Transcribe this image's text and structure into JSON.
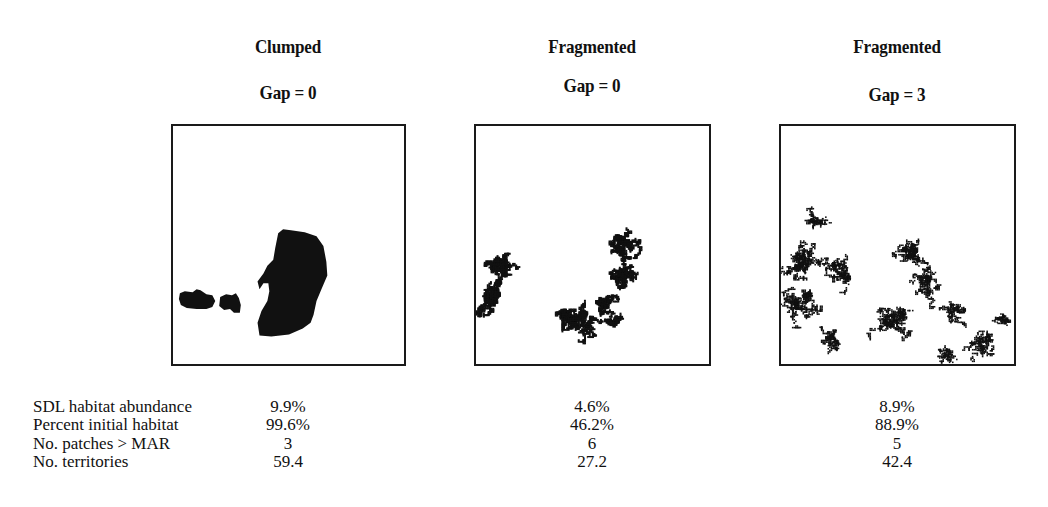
{
  "figure": {
    "panels": [
      {
        "title": "Clumped",
        "subtitle": "Gap = 0",
        "pattern": "clumped",
        "box": {
          "x": 171,
          "y": 124,
          "w": 235,
          "h": 242
        },
        "title_y": 36,
        "subtitle_y": 82,
        "blobs": [
          {
            "type": "path",
            "d": "M107 109 L112 105 L120 106 L134 108 L146 112 L153 122 L156 138 L157 152 L151 166 L146 178 L143 192 L140 200 L132 206 L118 212 L100 214 L88 213 L86 200 L90 188 L96 178 L98 168 L97 160 L92 160 L88 166 L86 158 L92 150 L96 142 L102 136 L104 124 Z"
          },
          {
            "type": "path",
            "d": "M7 170 L12 168 L20 169 L24 166 L28 167 L34 171 L40 172 L43 178 L40 184 L34 186 L24 186 L14 185 L8 182 L6 176 Z"
          },
          {
            "type": "path",
            "d": "M48 174 L54 171 L60 172 L64 170 L67 175 L69 182 L68 190 L62 190 L58 186 L52 187 L47 183 Z"
          }
        ]
      },
      {
        "title": "Fragmented",
        "subtitle": "Gap = 0",
        "pattern": "fragmented",
        "box": {
          "x": 474,
          "y": 124,
          "w": 237,
          "h": 242
        },
        "title_y": 36,
        "subtitle_y": 75,
        "clusters": [
          {
            "cx": 22,
            "cy": 142,
            "r": 22,
            "n": 650,
            "seed": 11
          },
          {
            "cx": 14,
            "cy": 175,
            "r": 24,
            "n": 750,
            "seed": 12
          },
          {
            "cx": 146,
            "cy": 124,
            "r": 22,
            "n": 600,
            "seed": 13
          },
          {
            "cx": 147,
            "cy": 155,
            "r": 18,
            "n": 500,
            "seed": 14
          },
          {
            "cx": 132,
            "cy": 180,
            "r": 14,
            "n": 300,
            "seed": 15
          },
          {
            "cx": 100,
            "cy": 202,
            "r": 28,
            "n": 900,
            "seed": 16
          },
          {
            "cx": 140,
            "cy": 197,
            "r": 10,
            "n": 200,
            "seed": 17
          }
        ]
      },
      {
        "title": "Fragmented",
        "subtitle": "Gap = 3",
        "pattern": "fragmented-gap",
        "box": {
          "x": 779,
          "y": 124,
          "w": 237,
          "h": 242
        },
        "title_y": 36,
        "subtitle_y": 84,
        "clusters": [
          {
            "cx": 36,
            "cy": 94,
            "r": 20,
            "n": 260,
            "seed": 21
          },
          {
            "cx": 20,
            "cy": 140,
            "r": 30,
            "n": 900,
            "seed": 22
          },
          {
            "cx": 20,
            "cy": 180,
            "r": 30,
            "n": 900,
            "seed": 23
          },
          {
            "cx": 60,
            "cy": 150,
            "r": 30,
            "n": 600,
            "seed": 24
          },
          {
            "cx": 50,
            "cy": 215,
            "r": 22,
            "n": 350,
            "seed": 25
          },
          {
            "cx": 130,
            "cy": 130,
            "r": 28,
            "n": 650,
            "seed": 26
          },
          {
            "cx": 150,
            "cy": 160,
            "r": 28,
            "n": 550,
            "seed": 27
          },
          {
            "cx": 115,
            "cy": 200,
            "r": 32,
            "n": 900,
            "seed": 28
          },
          {
            "cx": 175,
            "cy": 190,
            "r": 25,
            "n": 350,
            "seed": 29
          },
          {
            "cx": 205,
            "cy": 220,
            "r": 25,
            "n": 450,
            "seed": 30
          },
          {
            "cx": 225,
            "cy": 195,
            "r": 14,
            "n": 200,
            "seed": 31
          },
          {
            "cx": 165,
            "cy": 232,
            "r": 20,
            "n": 250,
            "seed": 32
          }
        ]
      }
    ]
  },
  "table": {
    "rows": [
      {
        "label": "SDL habitat abundance",
        "values": [
          "9.9%",
          "4.6%",
          "8.9%"
        ],
        "y": 397
      },
      {
        "label": "Percent initial habitat",
        "values": [
          "99.6%",
          "46.2%",
          "88.9%"
        ],
        "y": 415
      },
      {
        "label": "No. patches > MAR",
        "values": [
          "3",
          "6",
          "5"
        ],
        "y": 434
      },
      {
        "label": "No. territories",
        "values": [
          "59.4",
          "27.2",
          "42.4"
        ],
        "y": 452
      }
    ],
    "column_centers": [
      288,
      592,
      897
    ]
  },
  "colors": {
    "ink": "#111111",
    "border": "#1a1a1a",
    "background": "#ffffff"
  }
}
